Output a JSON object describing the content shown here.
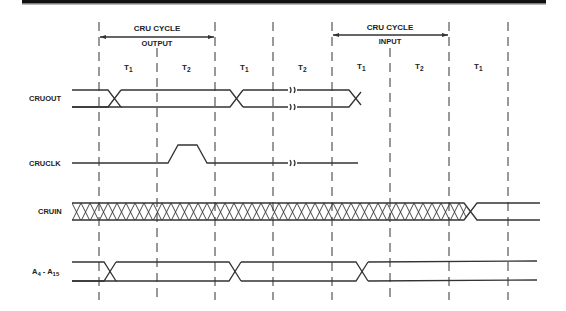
{
  "diagram": {
    "top_bar_color": "#111111",
    "ink_color": "#333333",
    "cycle_annotations": [
      {
        "label": "CRU CYCLE",
        "sublabel": "OUTPUT",
        "x_start": 99,
        "x_end": 215
      },
      {
        "label": "CRU CYCLE",
        "sublabel": "INPUT",
        "x_start": 332,
        "x_end": 449
      }
    ],
    "phases": [
      {
        "label": "T",
        "sub": "1",
        "x": 128
      },
      {
        "label": "T",
        "sub": "2",
        "x": 186
      },
      {
        "label": "T",
        "sub": "1",
        "x": 244
      },
      {
        "label": "T",
        "sub": "2",
        "x": 302
      },
      {
        "label": "T",
        "sub": "1",
        "x": 361
      },
      {
        "label": "T",
        "sub": "2",
        "x": 419
      },
      {
        "label": "T",
        "sub": "1",
        "x": 478
      }
    ],
    "gridlines_x": [
      99,
      157,
      215,
      273,
      332,
      390,
      449,
      508
    ],
    "signals": [
      {
        "name": "CRUOUT",
        "label": "CRUOUT",
        "label_sub": "",
        "y": 98
      },
      {
        "name": "CRUCLK",
        "label": "CRUCLK",
        "label_sub": "",
        "y": 163
      },
      {
        "name": "CRUIN",
        "label": "CRUIN",
        "label_sub": "",
        "y": 211
      },
      {
        "name": "A4-A15",
        "label": "A",
        "label_sub": "4",
        "label2": " - A",
        "label2_sub": "15",
        "y": 271
      }
    ]
  }
}
